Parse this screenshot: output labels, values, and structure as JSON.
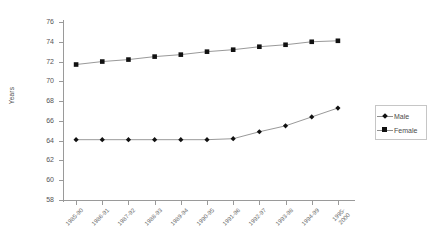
{
  "chart_data": {
    "type": "line",
    "title": "",
    "xlabel": "",
    "ylabel": "Years",
    "ylim": [
      58,
      76
    ],
    "yticks": [
      58,
      60,
      62,
      64,
      66,
      68,
      70,
      72,
      74,
      76
    ],
    "grid": false,
    "legend_position": "right",
    "categories": [
      "1985-90",
      "1986-91",
      "1987-92",
      "1988-93",
      "1989-94",
      "1990-95",
      "1991-96",
      "1992-97",
      "1993-98",
      "1994-99",
      "1995-2000"
    ],
    "series": [
      {
        "name": "Male",
        "marker": "diamond",
        "values": [
          64.1,
          64.1,
          64.1,
          64.1,
          64.1,
          64.1,
          64.2,
          64.9,
          65.5,
          66.4,
          67.3
        ]
      },
      {
        "name": "Female",
        "marker": "square",
        "values": [
          71.7,
          72.0,
          72.2,
          72.5,
          72.7,
          73.0,
          73.2,
          73.5,
          73.7,
          74.0,
          74.1
        ]
      }
    ],
    "colors": {
      "marker": "#111111",
      "line": "#8d8d8d",
      "axis": "#9a9a9a",
      "text": "#555555"
    }
  },
  "legend": {
    "items": [
      {
        "label": "Male"
      },
      {
        "label": "Female"
      }
    ]
  }
}
